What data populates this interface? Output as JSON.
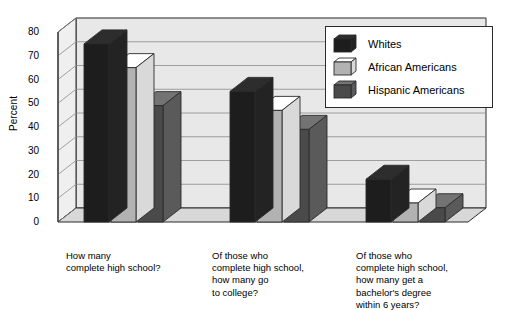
{
  "chart_data": {
    "type": "bar",
    "title": "",
    "subtitle": "",
    "xlabel": "",
    "ylabel": "Percent",
    "ylim": [
      0,
      80
    ],
    "ytick_step": 10,
    "yticks": [
      80,
      70,
      60,
      50,
      40,
      30,
      20,
      10,
      0
    ],
    "grid": true,
    "legend_position": "top-right",
    "style": "3d-bar",
    "categories": [
      "How many\ncomplete high school?",
      "Of those who\ncomplete high school,\nhow many go\nto college?",
      "Of those who\ncomplete high school,\nhow many get a\nbachelor's degree\nwithin 6 years?"
    ],
    "series": [
      {
        "name": "Whites",
        "color": "#1d1d1d",
        "values": [
          75,
          55,
          18
        ]
      },
      {
        "name": "African Americans",
        "color": "#b2b2b2",
        "values": [
          65,
          47,
          8
        ]
      },
      {
        "name": "Hispanic Americans",
        "color": "#4a4a4a",
        "values": [
          49,
          39,
          6
        ]
      }
    ]
  },
  "legend": {
    "items": [
      {
        "label": "Whites"
      },
      {
        "label": "African Americans"
      },
      {
        "label": "Hispanic Americans"
      }
    ]
  },
  "colors": {
    "series_1": "#1d1d1d",
    "series_2": "#b2b2b2",
    "series_3": "#4a4a4a",
    "wall": "#e8e8e8",
    "floor": "#d8d8d8",
    "gridline": "#8a8a8a",
    "outline": "#2b2b2b"
  }
}
